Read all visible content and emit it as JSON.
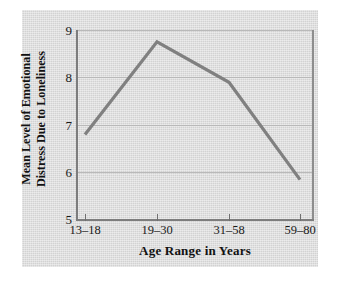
{
  "chart_data": {
    "type": "line",
    "title": "",
    "xlabel": "Age Range in Years",
    "ylabel_line1": "Mean Level of Emotional",
    "ylabel_line2": "Distress Due to Loneliness",
    "ylabel": "Mean Level of Emotional Distress Due to Loneliness",
    "categories": [
      "13–18",
      "19–30",
      "31–58",
      "59–80"
    ],
    "values": [
      6.8,
      8.75,
      7.9,
      5.85
    ],
    "series": [
      {
        "name": "Mean Level of Emotional Distress Due to Loneliness",
        "values": [
          6.8,
          8.75,
          7.9,
          5.85
        ]
      }
    ],
    "ylim": [
      5,
      9
    ],
    "yticks": [
      9,
      8,
      7,
      6,
      5
    ],
    "ytick_labels": [
      "9",
      "8",
      "7",
      "6",
      "5"
    ],
    "xtick_labels": [
      "13–18",
      "19–30",
      "31–58",
      "59–80"
    ],
    "grid": "horizontal",
    "legend": "none",
    "markers": "none",
    "line_color": "#808080",
    "grid_color": "#b9b9b9",
    "axis_color": "#7d7d7d",
    "panel_color": "#dcdcdc",
    "background_color": "#ffffff",
    "text_color": "#121212"
  }
}
